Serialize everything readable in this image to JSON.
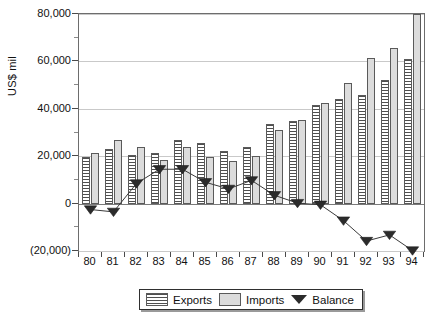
{
  "chart_data": {
    "type": "bar",
    "title": "",
    "subtitle": "",
    "xlabel": "",
    "ylabel": "US$ mil",
    "categories": [
      "80",
      "81",
      "82",
      "83",
      "84",
      "85",
      "86",
      "87",
      "88",
      "89",
      "90",
      "91",
      "92",
      "93",
      "94"
    ],
    "ylim": [
      -20000,
      80000
    ],
    "yticks": [
      80000,
      60000,
      40000,
      20000,
      0,
      -20000
    ],
    "ytick_labels": [
      "80,000",
      "60,000",
      "40,000",
      "20,000",
      "0",
      "(20,000)"
    ],
    "grid": true,
    "legend_position": "bottom",
    "series": [
      {
        "name": "Exports",
        "kind": "bar",
        "color": "#4f4f4f",
        "fill": "horizontal-hatch",
        "values": [
          19500,
          23000,
          20500,
          21500,
          27000,
          25600,
          22400,
          24000,
          33500,
          34800,
          41500,
          44000,
          46000,
          52000,
          61000
        ]
      },
      {
        "name": "Imports",
        "kind": "bar",
        "color": "#dcdcdc",
        "fill": "solid",
        "values": [
          21500,
          27000,
          24000,
          18500,
          24000,
          19800,
          18000,
          20000,
          31000,
          35200,
          42500,
          51000,
          61500,
          65500,
          80000
        ]
      },
      {
        "name": "Balance",
        "kind": "line",
        "marker": "triangle-down",
        "color": "#2b2b2b",
        "values": [
          -2500,
          -3500,
          8500,
          14500,
          14500,
          9000,
          6200,
          9800,
          3500,
          200,
          -500,
          -7200,
          -15800,
          -13200,
          -19800
        ]
      }
    ]
  },
  "legend": {
    "items": [
      {
        "label": "Exports",
        "swatch": "exports-hatch-swatch"
      },
      {
        "label": "Imports",
        "swatch": "imports-gray-swatch"
      },
      {
        "label": "Balance",
        "swatch": "balance-triangle-marker"
      }
    ]
  }
}
